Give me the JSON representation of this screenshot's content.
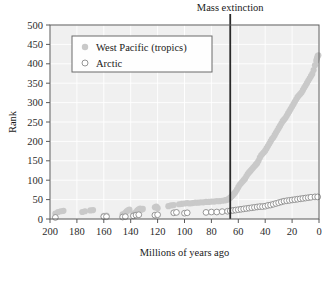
{
  "figure": {
    "background": "#ffffff",
    "plot_background": "#f0f0f0",
    "gridline_color": "#ffffff",
    "frame_color": "#5a5a5a"
  },
  "legend": {
    "position": "upper-left-inside",
    "border_color": "#6b6b6b",
    "background": "#fefefe",
    "entries": [
      {
        "label": "West Pacific (tropics)",
        "marker": "filled-circle",
        "color": "#c9c9c9"
      },
      {
        "label": "Arctic",
        "marker": "open-circle",
        "color": "#ffffff",
        "edge": "#8a8a8a"
      }
    ]
  },
  "annotation": {
    "label": "Mass extinction",
    "x_value": 66,
    "line_color": "#2a2a2a"
  },
  "chart_data": {
    "type": "scatter",
    "title": "",
    "xlabel": "Millions of years ago",
    "ylabel": "Rank",
    "xlim": [
      200,
      0
    ],
    "ylim": [
      0,
      500
    ],
    "x_reversed": true,
    "xticks": [
      200,
      180,
      160,
      140,
      120,
      100,
      80,
      60,
      40,
      20,
      0
    ],
    "yticks": [
      0,
      50,
      100,
      150,
      200,
      250,
      300,
      350,
      400,
      450,
      500
    ],
    "grid": true,
    "legend_position": "upper left",
    "annotations": [
      {
        "text": "Mass extinction",
        "x": 66,
        "type": "vline"
      }
    ],
    "series": [
      {
        "name": "West Pacific (tropics)",
        "marker": "filled-circle",
        "color": "#c9c9c9",
        "points": [
          [
            196,
            14
          ],
          [
            194,
            18
          ],
          [
            192,
            20
          ],
          [
            190,
            21
          ],
          [
            176,
            18
          ],
          [
            174,
            20
          ],
          [
            170,
            22
          ],
          [
            168,
            23
          ],
          [
            160,
            8
          ],
          [
            158,
            9
          ],
          [
            146,
            12
          ],
          [
            144,
            16
          ],
          [
            143,
            20
          ],
          [
            142,
            22
          ],
          [
            141,
            24
          ],
          [
            138,
            14
          ],
          [
            136,
            18
          ],
          [
            135,
            22
          ],
          [
            134,
            25
          ],
          [
            133,
            27
          ],
          [
            132,
            24
          ],
          [
            131,
            26
          ],
          [
            122,
            30
          ],
          [
            121,
            32
          ],
          [
            120,
            28
          ],
          [
            112,
            33
          ],
          [
            110,
            35
          ],
          [
            108,
            36
          ],
          [
            104,
            38
          ],
          [
            102,
            39
          ],
          [
            100,
            40
          ],
          [
            98,
            41
          ],
          [
            96,
            40
          ],
          [
            94,
            41
          ],
          [
            92,
            42
          ],
          [
            90,
            42
          ],
          [
            88,
            43
          ],
          [
            86,
            43
          ],
          [
            84,
            44
          ],
          [
            82,
            44
          ],
          [
            80,
            45
          ],
          [
            78,
            45
          ],
          [
            76,
            46
          ],
          [
            74,
            46
          ],
          [
            72,
            47
          ],
          [
            70,
            48
          ],
          [
            69,
            49
          ],
          [
            68,
            50
          ],
          [
            67,
            52
          ],
          [
            66,
            55
          ],
          [
            65,
            58
          ],
          [
            64,
            62
          ],
          [
            63,
            66
          ],
          [
            62,
            70
          ],
          [
            61,
            76
          ],
          [
            60,
            82
          ],
          [
            59,
            88
          ],
          [
            58,
            92
          ],
          [
            57,
            96
          ],
          [
            56,
            100
          ],
          [
            55,
            104
          ],
          [
            54,
            110
          ],
          [
            53,
            116
          ],
          [
            52,
            120
          ],
          [
            51,
            124
          ],
          [
            50,
            128
          ],
          [
            49,
            132
          ],
          [
            48,
            136
          ],
          [
            47,
            140
          ],
          [
            46,
            144
          ],
          [
            45,
            150
          ],
          [
            44,
            158
          ],
          [
            43,
            164
          ],
          [
            42,
            168
          ],
          [
            41,
            172
          ],
          [
            40,
            176
          ],
          [
            39,
            182
          ],
          [
            38,
            188
          ],
          [
            37,
            194
          ],
          [
            36,
            200
          ],
          [
            35,
            206
          ],
          [
            34,
            210
          ],
          [
            33,
            216
          ],
          [
            32,
            222
          ],
          [
            31,
            228
          ],
          [
            30,
            234
          ],
          [
            29,
            240
          ],
          [
            28,
            246
          ],
          [
            27,
            252
          ],
          [
            26,
            256
          ],
          [
            25,
            260
          ],
          [
            24,
            266
          ],
          [
            23,
            272
          ],
          [
            22,
            278
          ],
          [
            21,
            284
          ],
          [
            20,
            290
          ],
          [
            19,
            296
          ],
          [
            18,
            302
          ],
          [
            17,
            308
          ],
          [
            16,
            314
          ],
          [
            15,
            318
          ],
          [
            14,
            322
          ],
          [
            13,
            326
          ],
          [
            12,
            332
          ],
          [
            11,
            338
          ],
          [
            10,
            344
          ],
          [
            9,
            350
          ],
          [
            8,
            356
          ],
          [
            7,
            362
          ],
          [
            6,
            368
          ],
          [
            5,
            374
          ],
          [
            4,
            384
          ],
          [
            3,
            396
          ],
          [
            2,
            408
          ],
          [
            1.5,
            414
          ],
          [
            1,
            420
          ],
          [
            0.5,
            422
          ]
        ]
      },
      {
        "name": "Arctic",
        "marker": "open-circle",
        "color": "#ffffff",
        "edge_color": "#8a8a8a",
        "points": [
          [
            196,
            4
          ],
          [
            160,
            6
          ],
          [
            158,
            6
          ],
          [
            146,
            5
          ],
          [
            144,
            6
          ],
          [
            138,
            8
          ],
          [
            136,
            10
          ],
          [
            134,
            11
          ],
          [
            122,
            10
          ],
          [
            120,
            11
          ],
          [
            108,
            16
          ],
          [
            106,
            17
          ],
          [
            100,
            15
          ],
          [
            98,
            16
          ],
          [
            84,
            17
          ],
          [
            80,
            18
          ],
          [
            76,
            18
          ],
          [
            72,
            19
          ],
          [
            68,
            20
          ],
          [
            66,
            21
          ],
          [
            64,
            22
          ],
          [
            62,
            23
          ],
          [
            60,
            24
          ],
          [
            58,
            25
          ],
          [
            56,
            26
          ],
          [
            54,
            27
          ],
          [
            52,
            28
          ],
          [
            50,
            29
          ],
          [
            48,
            30
          ],
          [
            46,
            31
          ],
          [
            44,
            32
          ],
          [
            42,
            32
          ],
          [
            40,
            33
          ],
          [
            38,
            35
          ],
          [
            36,
            36
          ],
          [
            34,
            38
          ],
          [
            32,
            40
          ],
          [
            30,
            42
          ],
          [
            28,
            44
          ],
          [
            26,
            46
          ],
          [
            24,
            47
          ],
          [
            22,
            48
          ],
          [
            20,
            49
          ],
          [
            18,
            50
          ],
          [
            16,
            51
          ],
          [
            14,
            52
          ],
          [
            12,
            53
          ],
          [
            10,
            54
          ],
          [
            8,
            55
          ],
          [
            6,
            56
          ],
          [
            3,
            57
          ],
          [
            1,
            57
          ]
        ]
      }
    ]
  }
}
